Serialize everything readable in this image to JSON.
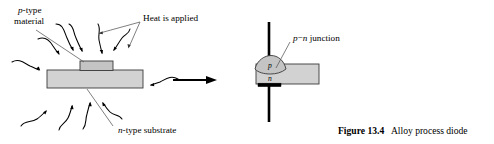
{
  "figure": {
    "caption_label": "Figure 13.4",
    "caption_text": "Alloy process diode",
    "labels": {
      "ptype_line1_italic": "p",
      "ptype_line1_rest": "-type",
      "ptype_line2": "material",
      "heat": "Heat is applied",
      "ntype_italic": "n",
      "ntype_rest": "-type substrate",
      "junction_p_italic": "p",
      "junction_dash": "−",
      "junction_n_italic": "n",
      "junction_rest": " junction"
    },
    "regions": {
      "p_region": "p",
      "n_region": "n"
    },
    "colors": {
      "body_fill": "#d2d2d2",
      "body_stroke": "#3a3a3a",
      "contact": "#000000",
      "leader": "#555555",
      "background": "#ffffff"
    },
    "left_diagram_name": "alloy-diode-before-heating",
    "right_diagram_name": "alloy-diode-after-heating",
    "process_arrow_name": "process-transition-arrow"
  }
}
